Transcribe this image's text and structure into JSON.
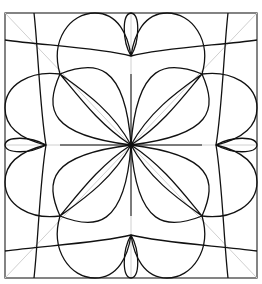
{
  "diagram": {
    "type": "geometric-pattern",
    "colors": {
      "background": "#ffffff",
      "stroke": "#111111",
      "guide": "#cfcfcf",
      "frame": "#333333"
    },
    "frame": {
      "x": 5,
      "y": 13,
      "width": 252,
      "height": 265
    },
    "center": {
      "x": 131,
      "y": 145
    },
    "diagonal_points": [
      {
        "x": 60,
        "y": 74
      },
      {
        "x": 202,
        "y": 74
      },
      {
        "x": 60,
        "y": 216
      },
      {
        "x": 202,
        "y": 216
      }
    ],
    "edge_midpoints": [
      {
        "name": "top",
        "x": 131,
        "y": 13
      },
      {
        "name": "bottom",
        "x": 131,
        "y": 278
      },
      {
        "name": "left",
        "x": 5,
        "y": 145
      },
      {
        "name": "right",
        "x": 257,
        "y": 145
      }
    ]
  }
}
